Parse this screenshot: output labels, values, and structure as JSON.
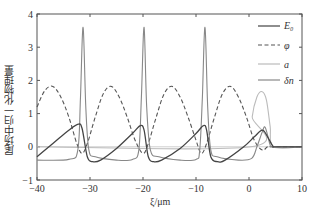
{
  "chart_data": {
    "type": "line",
    "title": "",
    "xlabel": "ξ/μm",
    "ylabel": "尾场中归一化物理量",
    "xlim": [
      -40,
      10
    ],
    "ylim": [
      -1,
      4
    ],
    "xticks": [
      "-40",
      "-30",
      "-20",
      "-10",
      "0",
      "10"
    ],
    "yticks": [
      "-1",
      "0",
      "1",
      "2",
      "3",
      "4"
    ],
    "grid": false,
    "legend_position": "upper right",
    "series": [
      {
        "name": "E0",
        "label": "E₀",
        "style": "solid",
        "color": "#444444",
        "x": [
          -40,
          -37,
          -34,
          -32.2,
          -31.5,
          -30.5,
          -29.5,
          -28,
          -25,
          -22,
          -20.5,
          -19.8,
          -19,
          -18,
          -16.5,
          -13,
          -10,
          -8.6,
          -8,
          -7.2,
          -6,
          -4.5,
          -1,
          1,
          2.5,
          3.5,
          4.5,
          5,
          10
        ],
        "y": [
          -0.3,
          0.1,
          0.5,
          0.68,
          0.55,
          -0.3,
          -0.45,
          -0.4,
          -0.05,
          0.4,
          0.64,
          0.5,
          -0.3,
          -0.45,
          -0.4,
          -0.05,
          0.4,
          0.64,
          0.5,
          -0.3,
          -0.45,
          -0.4,
          0,
          0.3,
          0.5,
          0.3,
          0.02,
          0,
          0
        ]
      },
      {
        "name": "phi",
        "label": "φ",
        "style": "dashed",
        "color": "#555555",
        "x": [
          -40,
          -38.5,
          -37,
          -35.5,
          -34,
          -32.5,
          -31.5,
          -30.5,
          -29,
          -27.5,
          -26,
          -24.5,
          -23,
          -21.5,
          -20,
          -19,
          -17.5,
          -16,
          -14.5,
          -13,
          -11.5,
          -10,
          -9,
          -8,
          -6.5,
          -5,
          -3.5,
          -2,
          -0.5,
          1,
          2.5,
          3.5,
          4.5,
          10
        ],
        "y": [
          1.2,
          1.7,
          1.82,
          1.5,
          0.9,
          0.1,
          -0.2,
          0.1,
          0.9,
          1.6,
          1.82,
          1.5,
          0.9,
          0.2,
          -0.2,
          0.1,
          0.9,
          1.6,
          1.82,
          1.5,
          0.9,
          0.2,
          -0.2,
          0.1,
          0.9,
          1.6,
          1.82,
          1.5,
          0.9,
          0.2,
          -0.1,
          0,
          0,
          0
        ]
      },
      {
        "name": "a",
        "label": "a",
        "style": "solid",
        "color": "#bbbbbb",
        "x": [
          -40,
          0.3,
          0.6,
          1.5,
          2.5,
          3.3,
          4,
          4.6,
          10
        ],
        "y": [
          0,
          0,
          0.9,
          1.5,
          1.66,
          1.4,
          0.6,
          0,
          0
        ]
      },
      {
        "name": "dn",
        "label": "δn",
        "style": "solid",
        "color": "#888888",
        "x": [
          -40,
          -34,
          -32.3,
          -31.8,
          -31.3,
          -30.8,
          -30.2,
          -29,
          -25,
          -22,
          -20.8,
          -20.3,
          -19.8,
          -19.3,
          -18.6,
          -17,
          -13,
          -10,
          -9.3,
          -8.8,
          -8.3,
          -7.8,
          -7.2,
          -6,
          -2,
          0.5,
          1.5,
          2.5,
          3,
          3.5,
          4,
          4.5,
          10
        ],
        "y": [
          -0.4,
          -0.38,
          -0.1,
          1.5,
          3.6,
          1.2,
          -0.1,
          -0.3,
          -0.4,
          -0.38,
          -0.1,
          1.5,
          3.6,
          1.2,
          -0.1,
          -0.3,
          -0.4,
          -0.38,
          -0.1,
          1.5,
          3.6,
          1.2,
          -0.1,
          -0.3,
          -0.4,
          -0.35,
          0,
          0.45,
          0.6,
          0.35,
          0.05,
          0,
          0
        ]
      }
    ]
  },
  "legend": {
    "items": [
      "E₀",
      "φ",
      "a",
      "δn"
    ]
  },
  "axis": {
    "xlabel": "ξ/μm",
    "ylabel": "尾场中归一化物理量"
  }
}
